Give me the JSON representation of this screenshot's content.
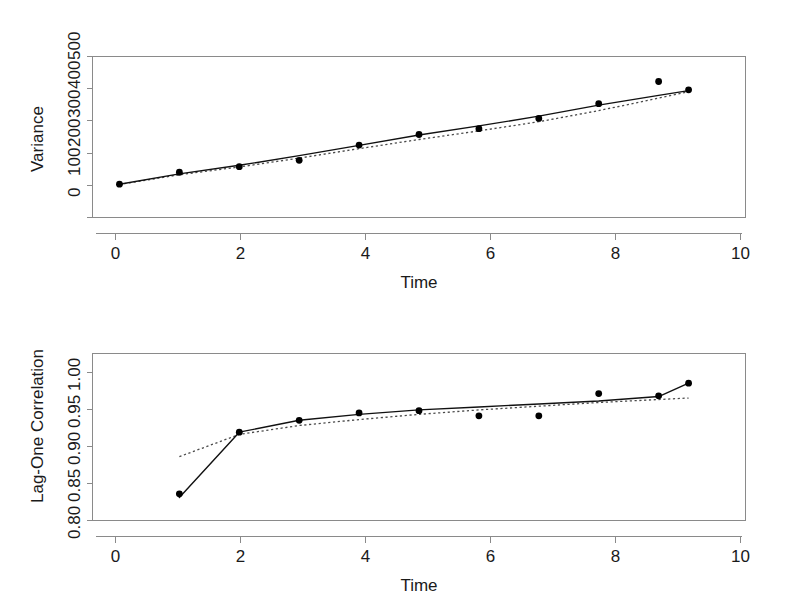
{
  "figure": {
    "background_color": "#ffffff",
    "axis_color": "#8a8a8a",
    "data_color": "#000000",
    "reference_color": "#4a4a4a",
    "panel_count": 2
  },
  "chart_data": [
    {
      "type": "scatter",
      "panel": "top",
      "title": "",
      "xlabel": "Time",
      "ylabel": "Variance",
      "xlim": [
        -0.45,
        10.45
      ],
      "ylim": [
        -20,
        560
      ],
      "xticks": [
        0,
        2,
        4,
        6,
        8,
        10
      ],
      "xticklabels": [
        "0",
        "2",
        "4",
        "6",
        "8",
        "10"
      ],
      "yticks": [
        0,
        100,
        200,
        300,
        400,
        500
      ],
      "yticklabels": [
        "0",
        "100",
        "200",
        "300",
        "400",
        "500"
      ],
      "grid": false,
      "legend": "none",
      "series": [
        {
          "name": "Observed variance",
          "style": "points",
          "x": [
            0,
            1,
            2,
            3,
            4,
            5,
            6,
            7,
            8,
            9,
            9.5
          ],
          "y": [
            100,
            143,
            163,
            186,
            241,
            279,
            300,
            337,
            390,
            470,
            440
          ]
        },
        {
          "name": "Fitted model (solid)",
          "style": "line-solid",
          "x": [
            0,
            1,
            2,
            3,
            4,
            5,
            6,
            7,
            8,
            9,
            9.5
          ],
          "y": [
            100,
            137,
            168,
            203,
            240,
            277,
            310,
            345,
            385,
            420,
            437
          ]
        },
        {
          "name": "Reference model (dotted)",
          "style": "line-dotted",
          "x": [
            0,
            1,
            2,
            3,
            4,
            5,
            6,
            7,
            8,
            9,
            9.5
          ],
          "y": [
            99,
            134,
            162,
            194,
            228,
            261,
            292,
            325,
            365,
            410,
            433
          ]
        }
      ]
    },
    {
      "type": "scatter",
      "panel": "bottom",
      "title": "",
      "xlabel": "Time",
      "ylabel": "Lag-One Correlation",
      "xlim": [
        -0.45,
        10.45
      ],
      "ylim": [
        0.787,
        1.012
      ],
      "xticks": [
        0,
        2,
        4,
        6,
        8,
        10
      ],
      "xticklabels": [
        "0",
        "2",
        "4",
        "6",
        "8",
        "10"
      ],
      "yticks": [
        0.8,
        0.85,
        0.9,
        0.95,
        1.0
      ],
      "yticklabels": [
        "0.80",
        "0.85",
        "0.90",
        "0.95",
        "1.00"
      ],
      "grid": false,
      "legend": "none",
      "series": [
        {
          "name": "Observed lag-one correlation",
          "style": "points",
          "x": [
            1,
            2,
            3,
            4,
            5,
            6,
            7,
            8,
            9,
            9.5
          ],
          "y": [
            0.823,
            0.906,
            0.922,
            0.932,
            0.935,
            0.928,
            0.928,
            0.958,
            0.955,
            0.972
          ]
        },
        {
          "name": "Fitted model (solid)",
          "style": "line-solid",
          "x": [
            1,
            2,
            3,
            4,
            5,
            6,
            7,
            8,
            9,
            9.5
          ],
          "y": [
            0.818,
            0.906,
            0.922,
            0.93,
            0.936,
            0.94,
            0.944,
            0.948,
            0.954,
            0.972
          ]
        },
        {
          "name": "Reference model (dotted)",
          "style": "line-dotted",
          "x": [
            1,
            2,
            3,
            4,
            5,
            6,
            7,
            8,
            9,
            9.5
          ],
          "y": [
            0.873,
            0.903,
            0.915,
            0.923,
            0.93,
            0.936,
            0.941,
            0.946,
            0.95,
            0.952
          ]
        }
      ]
    }
  ]
}
